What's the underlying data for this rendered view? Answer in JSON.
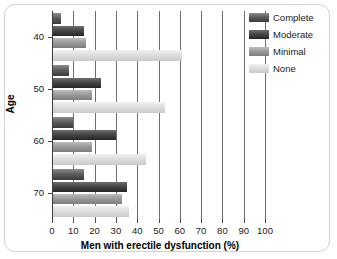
{
  "chart_data": {
    "type": "bar",
    "orientation": "horizontal",
    "title": "",
    "xlabel": "Men with erectile dysfunction (%)",
    "ylabel": "Age",
    "xlim": [
      0,
      100
    ],
    "xticks": [
      0,
      10,
      20,
      30,
      40,
      50,
      60,
      70,
      80,
      90,
      100
    ],
    "xtick_labels": [
      "0",
      "10",
      "20",
      "30",
      "40",
      "50",
      "60",
      "70",
      "80",
      "90",
      "100"
    ],
    "categories": [
      "40",
      "50",
      "60",
      "70"
    ],
    "ytick_labels": [
      "40",
      "50",
      "60",
      "70"
    ],
    "grid": "vertical",
    "legend_position": "top-right",
    "series": [
      {
        "name": "Complete",
        "color": "#4a4a4a",
        "values": [
          4,
          8,
          10,
          15
        ]
      },
      {
        "name": "Moderate",
        "color": "#2b2b2b",
        "values": [
          15,
          23,
          30,
          35
        ]
      },
      {
        "name": "Minimal",
        "color": "#9b9b9b",
        "values": [
          16,
          19,
          19,
          33
        ]
      },
      {
        "name": "None",
        "color": "#dcdcdc",
        "values": [
          61,
          53,
          44,
          36
        ]
      }
    ]
  },
  "legend": {
    "entries": [
      {
        "label": "Complete",
        "swatch": "legend-swatch-complete"
      },
      {
        "label": "Moderate",
        "swatch": "legend-swatch-moderate"
      },
      {
        "label": "Minimal",
        "swatch": "legend-swatch-minimal"
      },
      {
        "label": "None",
        "swatch": "legend-swatch-none"
      }
    ]
  }
}
